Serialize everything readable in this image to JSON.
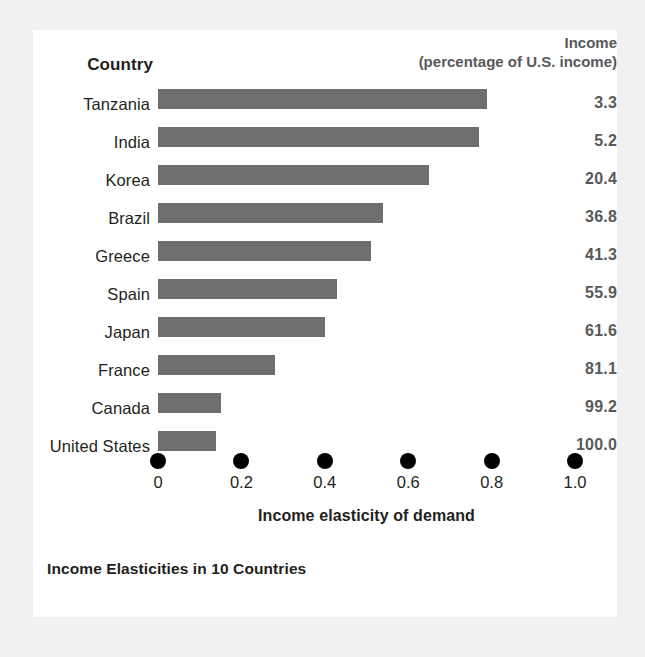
{
  "header": {
    "country_label": "Country",
    "income_label": "Income",
    "income_sublabel": "(percentage of U.S. income)"
  },
  "axis": {
    "title": "Income elasticity of demand",
    "ticks": [
      "0",
      "0.2",
      "0.4",
      "0.6",
      "0.8",
      "1.0"
    ]
  },
  "caption": "Income Elasticities in 10 Countries",
  "colors": {
    "bar": "#6e6e6e",
    "value_text": "#58595b",
    "tick_dot": "#000000",
    "card_background": "#ffffff",
    "page_background": "#f1f1f1"
  },
  "chart_data": {
    "type": "bar",
    "orientation": "horizontal",
    "title": "Income Elasticities in 10 Countries",
    "xlabel": "Income elasticity of demand",
    "ylabel": "Country",
    "xlim": [
      0,
      1.0
    ],
    "xticks": [
      0,
      0.2,
      0.4,
      0.6,
      0.8,
      1.0
    ],
    "grid": false,
    "legend": "none",
    "categories": [
      "Tanzania",
      "India",
      "Korea",
      "Brazil",
      "Greece",
      "Spain",
      "Japan",
      "France",
      "Canada",
      "United States"
    ],
    "values": [
      0.79,
      0.77,
      0.65,
      0.54,
      0.51,
      0.43,
      0.4,
      0.28,
      0.15,
      0.14
    ],
    "series": [
      {
        "name": "Income elasticity of demand",
        "values": [
          0.79,
          0.77,
          0.65,
          0.54,
          0.51,
          0.43,
          0.4,
          0.28,
          0.15,
          0.14
        ]
      },
      {
        "name": "Income (percentage of U.S. income)",
        "display_only": true,
        "values": [
          3.3,
          5.2,
          20.4,
          36.8,
          41.3,
          55.9,
          61.6,
          81.1,
          99.2,
          100.0
        ]
      }
    ],
    "rows": [
      {
        "country": "Tanzania",
        "elasticity": 0.79,
        "income": "3.3"
      },
      {
        "country": "India",
        "elasticity": 0.77,
        "income": "5.2"
      },
      {
        "country": "Korea",
        "elasticity": 0.65,
        "income": "20.4"
      },
      {
        "country": "Brazil",
        "elasticity": 0.54,
        "income": "36.8"
      },
      {
        "country": "Greece",
        "elasticity": 0.51,
        "income": "41.3"
      },
      {
        "country": "Spain",
        "elasticity": 0.43,
        "income": "55.9"
      },
      {
        "country": "Japan",
        "elasticity": 0.4,
        "income": "61.6"
      },
      {
        "country": "France",
        "elasticity": 0.28,
        "income": "81.1"
      },
      {
        "country": "Canada",
        "elasticity": 0.15,
        "income": "99.2"
      },
      {
        "country": "United States",
        "elasticity": 0.14,
        "income": "100.0"
      }
    ]
  }
}
